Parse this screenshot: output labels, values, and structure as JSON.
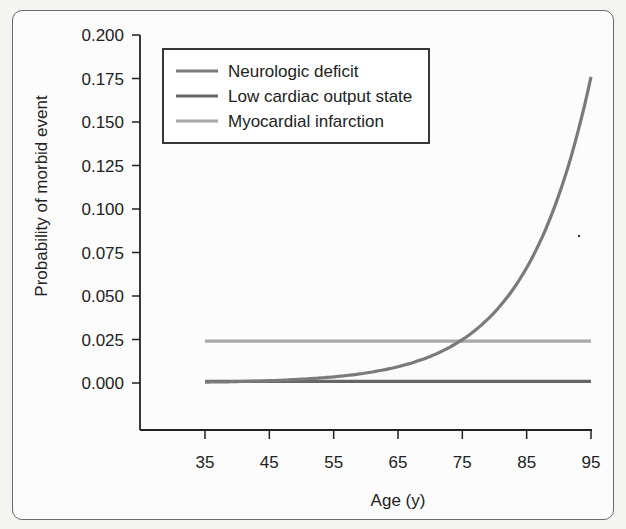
{
  "chart_data": {
    "type": "line",
    "title": "",
    "xlabel": "Age (y)",
    "ylabel": "Probability of morbid event",
    "xlim": [
      35,
      95
    ],
    "ylim": [
      0.0,
      0.2
    ],
    "x_ticks": [
      "35",
      "45",
      "55",
      "65",
      "75",
      "85",
      "95"
    ],
    "y_ticks": [
      "0.000",
      "0.025",
      "0.050",
      "0.075",
      "0.100",
      "0.125",
      "0.150",
      "0.175",
      "0.200"
    ],
    "grid": false,
    "legend_position": "upper-left",
    "x": [
      35,
      40,
      45,
      50,
      55,
      60,
      65,
      70,
      75,
      80,
      85,
      90,
      95
    ],
    "series": [
      {
        "name": "Neurologic deficit",
        "color": "#7a7a7a",
        "values": [
          0.0005,
          0.0007,
          0.0011,
          0.0018,
          0.003,
          0.005,
          0.0083,
          0.014,
          0.0235,
          0.0395,
          0.064,
          0.105,
          0.176
        ]
      },
      {
        "name": "Low cardiac output state",
        "color": "#666666",
        "values": [
          0.001,
          0.001,
          0.001,
          0.001,
          0.001,
          0.001,
          0.001,
          0.001,
          0.001,
          0.001,
          0.001,
          0.001,
          0.001
        ]
      },
      {
        "name": "Myocardial infarction",
        "color": "#a8a8a8",
        "values": [
          0.024,
          0.024,
          0.024,
          0.024,
          0.024,
          0.024,
          0.024,
          0.024,
          0.024,
          0.024,
          0.024,
          0.024,
          0.024
        ]
      }
    ]
  },
  "legend": {
    "items": [
      {
        "label": "Neurologic deficit",
        "color": "#7a7a7a"
      },
      {
        "label": "Low cardiac output state",
        "color": "#666666"
      },
      {
        "label": "Myocardial infarction",
        "color": "#a8a8a8"
      }
    ]
  },
  "axes": {
    "xlabel": "Age (y)",
    "ylabel": "Probability of morbid event"
  }
}
